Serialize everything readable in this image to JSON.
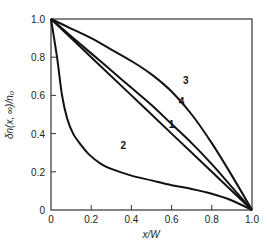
{
  "chart_data": {
    "type": "line",
    "title": "",
    "xlabel": "x/W",
    "ylabel": "δn(x, ∞)/n₀",
    "xlim": [
      0,
      1.0
    ],
    "ylim": [
      0,
      1.0
    ],
    "grid": false,
    "legend": "inline curve labels",
    "xticks": [
      "0",
      "0.2",
      "0.4",
      "0.6",
      "0.8",
      "1.0"
    ],
    "yticks": [
      "0",
      "0.2",
      "0.4",
      "0.6",
      "0.8",
      "1.0"
    ],
    "series": [
      {
        "name": "1",
        "x": [
          0,
          0.2,
          0.4,
          0.6,
          0.8,
          1.0
        ],
        "y": [
          1.0,
          0.8,
          0.6,
          0.4,
          0.2,
          0.0
        ],
        "label_pos": [
          0.6,
          0.43
        ]
      },
      {
        "name": "2",
        "x": [
          0,
          0.03,
          0.055,
          0.08,
          0.11,
          0.15,
          0.19,
          0.25,
          0.3,
          0.4,
          0.5,
          0.6,
          0.7,
          0.8,
          0.9,
          1.0
        ],
        "y": [
          1.0,
          0.8,
          0.6,
          0.48,
          0.4,
          0.34,
          0.29,
          0.24,
          0.215,
          0.18,
          0.155,
          0.13,
          0.11,
          0.085,
          0.05,
          0.0
        ],
        "label_pos": [
          0.36,
          0.32
        ]
      },
      {
        "name": "3",
        "x": [
          0,
          0.1,
          0.2,
          0.3,
          0.4,
          0.5,
          0.6,
          0.7,
          0.8,
          0.9,
          1.0
        ],
        "y": [
          1.0,
          0.95,
          0.9,
          0.84,
          0.78,
          0.71,
          0.62,
          0.5,
          0.35,
          0.18,
          0.0
        ],
        "label_pos": [
          0.67,
          0.66
        ]
      },
      {
        "name": "4",
        "x": [
          0,
          0.1,
          0.2,
          0.3,
          0.4,
          0.5,
          0.6,
          0.7,
          0.8,
          0.9,
          1.0
        ],
        "y": [
          1.0,
          0.91,
          0.82,
          0.73,
          0.64,
          0.55,
          0.45,
          0.35,
          0.24,
          0.12,
          0.0
        ],
        "label_pos": [
          0.65,
          0.55
        ]
      }
    ]
  }
}
